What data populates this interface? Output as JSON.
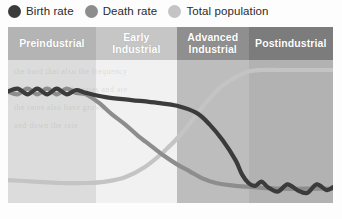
{
  "legend": {
    "items": [
      {
        "label": "Birth rate",
        "swatch": "circle-marker-dark",
        "color": "#3b3b3b"
      },
      {
        "label": "Death rate",
        "swatch": "circle-marker-medium",
        "color": "#8d8d8d"
      },
      {
        "label": "Total population",
        "swatch": "circle-marker-light",
        "color": "#c4c4c4"
      }
    ]
  },
  "bands": [
    {
      "label": "Preindustrial",
      "header_color": "#b4b4b4",
      "body_color": "#dcdcdc"
    },
    {
      "label": "Early\nIndustrial",
      "header_color": "#c6c6c6",
      "body_color": "#f1f1f1"
    },
    {
      "label": "Advanced\nIndustrial",
      "header_color": "#8f8f8f",
      "body_color": "#bdbdbd"
    },
    {
      "label": "Postindustrial",
      "header_color": "#7c7c7c",
      "body_color": "#b2b2b2"
    }
  ],
  "ghost_text": [
    "the hard that also the frequency",
    "born also have the rates and are",
    "the rates also have grown",
    "and down the rate"
  ],
  "chart_data": {
    "type": "line",
    "title": "",
    "subtitle": "",
    "xlabel": "",
    "ylabel": "",
    "grid": false,
    "legend_position": "top-left",
    "xlim": [
      0,
      100
    ],
    "ylim": [
      0,
      100
    ],
    "stages": [
      "Preindustrial",
      "Early Industrial",
      "Advanced Industrial",
      "Postindustrial"
    ],
    "stage_boundaries_pct": [
      0,
      27,
      52,
      74,
      100
    ],
    "series": [
      {
        "name": "Birth rate",
        "color": "#3b3b3b",
        "points": [
          [
            0,
            78
          ],
          [
            3,
            80
          ],
          [
            6,
            76
          ],
          [
            9,
            80
          ],
          [
            12,
            76
          ],
          [
            15,
            80
          ],
          [
            18,
            76
          ],
          [
            21,
            79
          ],
          [
            24,
            77
          ],
          [
            30,
            74
          ],
          [
            38,
            72
          ],
          [
            46,
            70
          ],
          [
            52,
            68
          ],
          [
            58,
            63
          ],
          [
            62,
            55
          ],
          [
            66,
            44
          ],
          [
            70,
            30
          ],
          [
            72,
            20
          ],
          [
            74,
            14
          ],
          [
            76,
            12
          ],
          [
            78,
            15
          ],
          [
            80,
            11
          ],
          [
            83,
            8
          ],
          [
            86,
            13
          ],
          [
            89,
            9
          ],
          [
            92,
            7
          ],
          [
            95,
            13
          ],
          [
            98,
            9
          ],
          [
            100,
            11
          ]
        ]
      },
      {
        "name": "Death rate",
        "color": "#8d8d8d",
        "points": [
          [
            0,
            78
          ],
          [
            3,
            76
          ],
          [
            6,
            80
          ],
          [
            9,
            76
          ],
          [
            12,
            80
          ],
          [
            15,
            76
          ],
          [
            18,
            80
          ],
          [
            21,
            77
          ],
          [
            24,
            76
          ],
          [
            28,
            70
          ],
          [
            32,
            62
          ],
          [
            36,
            55
          ],
          [
            40,
            47
          ],
          [
            44,
            40
          ],
          [
            48,
            33
          ],
          [
            52,
            27
          ],
          [
            56,
            22
          ],
          [
            60,
            17
          ],
          [
            64,
            14
          ],
          [
            70,
            12
          ],
          [
            76,
            11
          ],
          [
            84,
            10
          ],
          [
            92,
            10
          ],
          [
            100,
            10
          ]
        ]
      },
      {
        "name": "Total population",
        "color": "#c4c4c4",
        "points": [
          [
            0,
            16
          ],
          [
            8,
            15
          ],
          [
            16,
            14
          ],
          [
            24,
            14
          ],
          [
            30,
            15
          ],
          [
            36,
            18
          ],
          [
            42,
            25
          ],
          [
            48,
            36
          ],
          [
            54,
            50
          ],
          [
            58,
            62
          ],
          [
            62,
            73
          ],
          [
            66,
            82
          ],
          [
            70,
            88
          ],
          [
            74,
            92
          ],
          [
            78,
            93
          ],
          [
            84,
            93
          ],
          [
            92,
            93
          ],
          [
            100,
            93
          ]
        ]
      }
    ]
  }
}
